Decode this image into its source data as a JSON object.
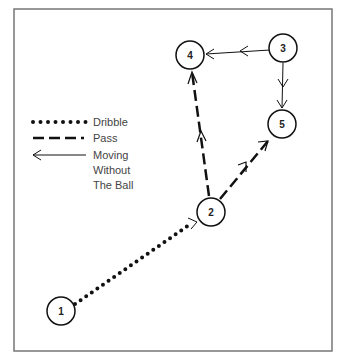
{
  "diagram": {
    "type": "basketball play diagram",
    "players": [
      {
        "id": "1",
        "label": "1",
        "x": 61,
        "y": 311
      },
      {
        "id": "2",
        "label": "2",
        "x": 211,
        "y": 212
      },
      {
        "id": "3",
        "label": "3",
        "x": 283,
        "y": 48
      },
      {
        "id": "4",
        "label": "4",
        "x": 190,
        "y": 55
      },
      {
        "id": "5",
        "label": "5",
        "x": 282,
        "y": 124
      }
    ],
    "movements": [
      {
        "from": "1",
        "to": "2",
        "type": "dribble"
      },
      {
        "from": "2",
        "to": "4",
        "type": "pass"
      },
      {
        "from": "2",
        "to": "5",
        "type": "pass"
      },
      {
        "from": "3",
        "to": "4",
        "type": "moving without the ball"
      },
      {
        "from": "3",
        "to": "5",
        "type": "moving without the ball"
      }
    ]
  },
  "legend": {
    "dribble": "Dribble",
    "pass": "Pass",
    "move_line1": "Moving",
    "move_line2": "Without",
    "move_line3": "The Ball"
  },
  "colors": {
    "line": "#111111",
    "border": "#777777"
  }
}
